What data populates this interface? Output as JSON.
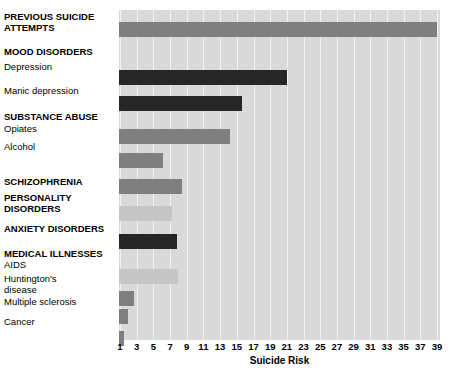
{
  "chart_data": {
    "type": "bar",
    "title": "",
    "xlabel": "Suicide Risk",
    "ylabel": "",
    "orientation": "horizontal",
    "xlim": [
      0,
      40
    ],
    "xticks": [
      1,
      3,
      5,
      7,
      9,
      11,
      13,
      15,
      17,
      19,
      21,
      23,
      25,
      27,
      29,
      31,
      33,
      35,
      37,
      39
    ],
    "grid": "vertical white gridlines on gray panel",
    "legend": "none",
    "colors": {
      "panel": "#d9d9d9",
      "gridline": "#f2f2f2",
      "bar_mid": "#7f7f7f",
      "bar_dark": "#262626",
      "bar_pale": "#c6c6c6",
      "text": "#000000"
    },
    "rows": [
      {
        "label": "PREVIOUS SUICIDE\nATTEMPTS",
        "bold": true,
        "value": 39.0,
        "shade": "mid",
        "top": 12,
        "label_top": 12
      },
      {
        "label": "MOOD DISORDERS",
        "bold": true,
        "value": null,
        "shade": null,
        "top": null,
        "label_top": 47
      },
      {
        "label": "Depression",
        "bold": false,
        "value": 21.0,
        "shade": "dark",
        "top": 60,
        "label_top": 62
      },
      {
        "label": "Manic depression",
        "bold": false,
        "value": 15.6,
        "shade": "dark",
        "top": 86,
        "label_top": 86
      },
      {
        "label": "SUBSTANCE ABUSE",
        "bold": true,
        "value": null,
        "shade": null,
        "top": null,
        "label_top": 112
      },
      {
        "label": "Opiates",
        "bold": false,
        "value": 14.2,
        "shade": "mid",
        "top": 119,
        "label_top": 124
      },
      {
        "label": "Alcohol",
        "bold": false,
        "value": 6.2,
        "shade": "mid",
        "top": 143,
        "label_top": 142
      },
      {
        "label": "SCHIZOPHRENIA",
        "bold": true,
        "value": 8.4,
        "shade": "mid",
        "top": 169,
        "label_top": 177
      },
      {
        "label": "PERSONALITY\nDISORDERS",
        "bold": true,
        "value": 7.2,
        "shade": "pale",
        "top": 196,
        "label_top": 193
      },
      {
        "label": "ANXIETY DISORDERS",
        "bold": true,
        "value": 7.8,
        "shade": "dark",
        "top": 224,
        "label_top": 224
      },
      {
        "label": "MEDICAL ILLNESSES",
        "bold": true,
        "value": null,
        "shade": null,
        "top": null,
        "label_top": 249
      },
      {
        "label": "AIDS",
        "bold": false,
        "value": 7.9,
        "shade": "pale",
        "top": 259,
        "label_top": 260
      },
      {
        "label": "Huntington's\ndisease",
        "bold": false,
        "value": 2.7,
        "shade": "mid",
        "top": 281,
        "label_top": 274
      },
      {
        "label": "Multiple sclerosis",
        "bold": false,
        "value": 1.9,
        "shade": "mid",
        "top": 299,
        "label_top": 297
      },
      {
        "label": "Cancer",
        "bold": false,
        "value": 1.5,
        "shade": "mid",
        "top": 321,
        "label_top": 317
      }
    ]
  }
}
